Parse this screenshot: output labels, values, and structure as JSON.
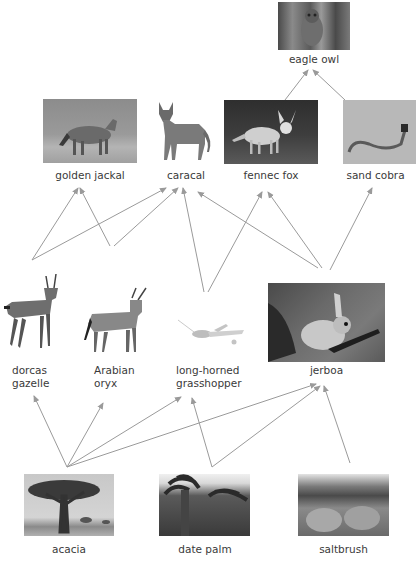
{
  "diagram": {
    "type": "food-web",
    "nodes": {
      "eagle_owl": {
        "label": "eagle owl",
        "level": "tertiary consumer"
      },
      "golden_jackal": {
        "label": "golden jackal",
        "level": "secondary consumer"
      },
      "caracal": {
        "label": "caracal",
        "level": "secondary consumer"
      },
      "fennec_fox": {
        "label": "fennec fox",
        "level": "secondary consumer"
      },
      "sand_cobra": {
        "label": "sand cobra",
        "level": "secondary consumer"
      },
      "dorcas_gazelle": {
        "label_line1": "dorcas",
        "label_line2": "gazelle",
        "level": "primary consumer"
      },
      "arabian_oryx": {
        "label_line1": "Arabian",
        "label_line2": "oryx",
        "level": "primary consumer"
      },
      "grasshopper": {
        "label_line1": "long-horned",
        "label_line2": "grasshopper",
        "level": "primary consumer"
      },
      "jerboa": {
        "label": "jerboa",
        "level": "primary consumer"
      },
      "acacia": {
        "label": "acacia",
        "level": "producer"
      },
      "date_palm": {
        "label": "date palm",
        "level": "producer"
      },
      "saltbrush": {
        "label": "saltbrush",
        "level": "producer"
      }
    },
    "edges": [
      {
        "from": "fennec fox",
        "to": "eagle owl"
      },
      {
        "from": "sand cobra",
        "to": "eagle owl"
      },
      {
        "from": "dorcas gazelle",
        "to": "golden jackal"
      },
      {
        "from": "dorcas gazelle",
        "to": "caracal"
      },
      {
        "from": "Arabian oryx",
        "to": "golden jackal"
      },
      {
        "from": "Arabian oryx",
        "to": "caracal"
      },
      {
        "from": "long-horned grasshopper",
        "to": "caracal"
      },
      {
        "from": "long-horned grasshopper",
        "to": "fennec fox"
      },
      {
        "from": "jerboa",
        "to": "caracal"
      },
      {
        "from": "jerboa",
        "to": "fennec fox"
      },
      {
        "from": "jerboa",
        "to": "sand cobra"
      },
      {
        "from": "acacia",
        "to": "dorcas gazelle"
      },
      {
        "from": "acacia",
        "to": "Arabian oryx"
      },
      {
        "from": "acacia",
        "to": "long-horned grasshopper"
      },
      {
        "from": "acacia",
        "to": "jerboa"
      },
      {
        "from": "date palm",
        "to": "long-horned grasshopper"
      },
      {
        "from": "date palm",
        "to": "jerboa"
      },
      {
        "from": "saltbrush",
        "to": "jerboa"
      }
    ],
    "arrow_color": "#9a9a9a"
  }
}
